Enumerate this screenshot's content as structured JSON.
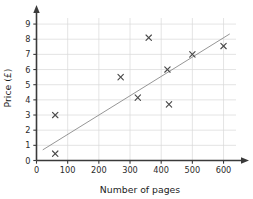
{
  "chart_data": {
    "type": "scatter",
    "title": "",
    "xlabel": "Number of pages",
    "ylabel": "Price (£)",
    "xlim": [
      0,
      640
    ],
    "ylim": [
      0,
      9.4
    ],
    "xticks": [
      0,
      100,
      200,
      300,
      400,
      500,
      600
    ],
    "xtick_labels": [
      "0",
      "100",
      "200",
      "300",
      "400",
      "500",
      "600"
    ],
    "yticks": [
      0,
      1,
      2,
      3,
      4,
      5,
      6,
      7,
      8,
      9
    ],
    "ytick_labels": [
      "0",
      "1",
      "2",
      "3",
      "4",
      "5",
      "6",
      "7",
      "8",
      "9"
    ],
    "grid": true,
    "legend": false,
    "marker": "x",
    "points": [
      {
        "x": 60,
        "y": 3.0
      },
      {
        "x": 60,
        "y": 0.45
      },
      {
        "x": 270,
        "y": 5.5
      },
      {
        "x": 325,
        "y": 4.15
      },
      {
        "x": 360,
        "y": 8.1
      },
      {
        "x": 420,
        "y": 6.0
      },
      {
        "x": 425,
        "y": 3.7
      },
      {
        "x": 500,
        "y": 7.0
      },
      {
        "x": 600,
        "y": 7.55
      }
    ],
    "trend_line": {
      "x0": 20,
      "y0": 0.7,
      "x1": 620,
      "y1": 8.35
    },
    "colors": {
      "grid": "#d8d8d8",
      "axis": "#3a3a3a",
      "marker": "#4a4a4a",
      "trend": "#8a8a8a",
      "background": "#ffffff"
    }
  }
}
